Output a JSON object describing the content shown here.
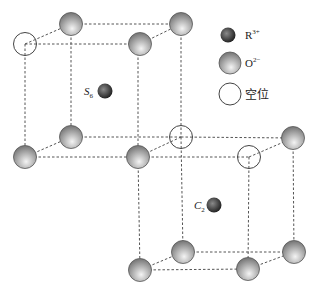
{
  "diagram": {
    "type": "crystal-structure",
    "legend": [
      {
        "symbol": "R",
        "sup": "3+",
        "kind": "cation"
      },
      {
        "symbol": "O",
        "sup": "2−",
        "kind": "oxygen"
      },
      {
        "symbol": "空位",
        "sup": "",
        "kind": "vacancy"
      }
    ],
    "sites": [
      {
        "label": "S",
        "sub": "6"
      },
      {
        "label": "C",
        "sub": "2"
      }
    ],
    "colors": {
      "oxygen_light": "#f2f2f2",
      "oxygen_dark": "#7a7a7a",
      "cation_light": "#8a8a8a",
      "cation_dark": "#1e1e1e",
      "line": "#555555"
    }
  }
}
